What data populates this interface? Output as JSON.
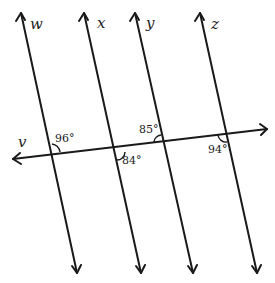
{
  "diagram": {
    "lines": [
      {
        "id": "w",
        "label": "w"
      },
      {
        "id": "x",
        "label": "x"
      },
      {
        "id": "y",
        "label": "y"
      },
      {
        "id": "z",
        "label": "z"
      }
    ],
    "transversal": {
      "id": "v",
      "label": "v"
    },
    "angles": [
      {
        "line": "w",
        "label": "96°",
        "position": "above-right"
      },
      {
        "line": "x",
        "label": "84°",
        "position": "below-right"
      },
      {
        "line": "y",
        "label": "85°",
        "position": "above-left"
      },
      {
        "line": "z",
        "label": "94°",
        "position": "below-left"
      }
    ],
    "colors": {
      "stroke": "#1a1a1a",
      "background": "#ffffff"
    }
  }
}
